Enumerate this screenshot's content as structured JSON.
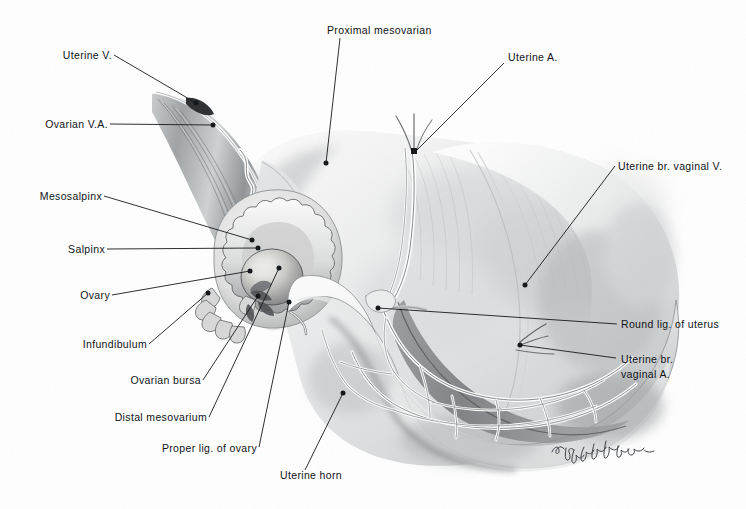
{
  "figure": {
    "background_color": "#ffffff",
    "ink_color": "#111418",
    "width": 746,
    "height": 509,
    "signature": "St. Ozmalachian"
  },
  "labels": [
    {
      "id": "uterine-v",
      "text": "Uterine V.",
      "side": "left"
    },
    {
      "id": "ovarian-va",
      "text": "Ovarian V.A.",
      "side": "left"
    },
    {
      "id": "mesosalpinx",
      "text": "Mesosalpinx",
      "side": "left"
    },
    {
      "id": "salpinx",
      "text": "Salpinx",
      "side": "left"
    },
    {
      "id": "ovary",
      "text": "Ovary",
      "side": "left"
    },
    {
      "id": "infundibulum",
      "text": "Infundibulum",
      "side": "left"
    },
    {
      "id": "ovarian-bursa",
      "text": "Ovarian bursa",
      "side": "left"
    },
    {
      "id": "distal-mesovarium",
      "text": "Distal mesovarium",
      "side": "left"
    },
    {
      "id": "proper-lig-of-ovary",
      "text": "Proper lig. of ovary",
      "side": "left"
    },
    {
      "id": "uterine-horn",
      "text": "Uterine horn",
      "side": "bottom"
    },
    {
      "id": "proximal-mesovarian",
      "text": "Proximal mesovarian",
      "side": "top"
    },
    {
      "id": "uterine-a",
      "text": "Uterine A.",
      "side": "top"
    },
    {
      "id": "uterine-br-vaginal-v",
      "text": "Uterine br. vaginal V.",
      "side": "right"
    },
    {
      "id": "round-lig-of-uterus",
      "text": "Round lig. of uterus",
      "side": "right"
    },
    {
      "id": "uterine-br-vaginal-a",
      "text": "Uterine br.\nvaginal A.",
      "side": "right"
    }
  ]
}
